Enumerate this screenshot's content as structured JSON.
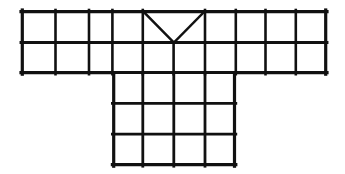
{
  "figure": {
    "name": "t-shaped-grid-diagram",
    "background_color": "#ffffff",
    "line_color": "#111111",
    "cell_fill_color": "#ffffff",
    "canvas": {
      "width": 345,
      "height": 174
    },
    "geometry": {
      "cell_size": 34,
      "origin_x": 21,
      "origin_y": 10,
      "stroke_width_outer": 3.2,
      "stroke_width_inner": 2.6,
      "stroke_width_diagonal": 2.4
    },
    "top_section": {
      "name": "upper-band",
      "columns": 9,
      "rows": 2,
      "x_start": 21,
      "x_end": 327,
      "y_start": 10,
      "y_end": 78
    },
    "bottom_section": {
      "name": "lower-body",
      "columns": 4,
      "rows": 3,
      "column_offset": 3,
      "x_start": 123,
      "x_end": 259,
      "y_start": 78,
      "y_end": 180
    },
    "neckline": {
      "name": "v-notch",
      "shape": "V",
      "left_x": 157,
      "right_x": 225,
      "top_y": 10,
      "vertex_x": 191,
      "vertex_y": 44,
      "spans_columns": [
        5,
        6
      ],
      "row": 1
    },
    "vertical_lines_top": [
      21,
      55,
      89,
      123,
      157,
      191,
      225,
      259,
      293,
      327
    ],
    "horizontal_lines_top": [
      10,
      44,
      78
    ],
    "vertical_lines_bottom": [
      123,
      157,
      191,
      225,
      259
    ],
    "horizontal_lines_bottom": [
      78,
      112,
      146,
      180
    ]
  }
}
